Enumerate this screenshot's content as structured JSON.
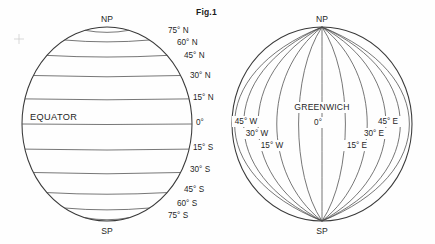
{
  "figure": {
    "title": "Fig.1",
    "canvas": {
      "width": 435,
      "height": 244
    }
  },
  "globe_latitudes": {
    "name": "parallels-globe",
    "center_x": 107,
    "center_y": 124,
    "radius_x": 85,
    "radius_y": 97,
    "pole_north_label": "NP",
    "pole_south_label": "SP",
    "equator_label": "EQUATOR",
    "parallels": [
      {
        "label": "75° N",
        "lat": 75,
        "label_x": 168,
        "label_y": 33
      },
      {
        "label": "60° N",
        "lat": 60,
        "label_x": 177,
        "label_y": 45
      },
      {
        "label": "45° N",
        "lat": 45,
        "label_x": 184,
        "label_y": 58
      },
      {
        "label": "30° N",
        "lat": 30,
        "label_x": 190,
        "label_y": 78
      },
      {
        "label": "15° N",
        "lat": 15,
        "label_x": 193,
        "label_y": 100
      },
      {
        "label": "0°",
        "lat": 0,
        "label_x": 196,
        "label_y": 125
      },
      {
        "label": "15° S",
        "lat": -15,
        "label_x": 193,
        "label_y": 150
      },
      {
        "label": "30° S",
        "lat": -30,
        "label_x": 190,
        "label_y": 172
      },
      {
        "label": "45° S",
        "lat": -45,
        "label_x": 184,
        "label_y": 192
      },
      {
        "label": "60° S",
        "lat": -60,
        "label_x": 177,
        "label_y": 206
      },
      {
        "label": "75° S",
        "lat": -75,
        "label_x": 168,
        "label_y": 218
      }
    ]
  },
  "globe_longitudes": {
    "name": "meridians-globe",
    "center_x": 322,
    "center_y": 124,
    "radius_x": 90,
    "radius_y": 97,
    "pole_north_label": "NP",
    "pole_south_label": "SP",
    "prime_meridian_label": "GREENWICH",
    "meridians": [
      {
        "label": "",
        "lon": -75
      },
      {
        "label": "",
        "lon": -60
      },
      {
        "label": "45° W",
        "lon": -45,
        "label_x": 246,
        "label_y": 124
      },
      {
        "label": "30° W",
        "lon": -30,
        "label_x": 257,
        "label_y": 136
      },
      {
        "label": "15° W",
        "lon": -15,
        "label_x": 272,
        "label_y": 148
      },
      {
        "label": "0°",
        "lon": 0,
        "label_x": 318,
        "label_y": 125
      },
      {
        "label": "15° E",
        "lon": 15,
        "label_x": 357,
        "label_y": 148
      },
      {
        "label": "30° E",
        "lon": 30,
        "label_x": 374,
        "label_y": 136
      },
      {
        "label": "45° E",
        "lon": 45,
        "label_x": 388,
        "label_y": 124
      },
      {
        "label": "",
        "lon": 60
      },
      {
        "label": "",
        "lon": 75
      }
    ]
  },
  "colors": {
    "ink": "#1e1e1e",
    "outline": "#3a3a3a",
    "gridline": "#4a4a4a",
    "background": "#fefefe"
  }
}
